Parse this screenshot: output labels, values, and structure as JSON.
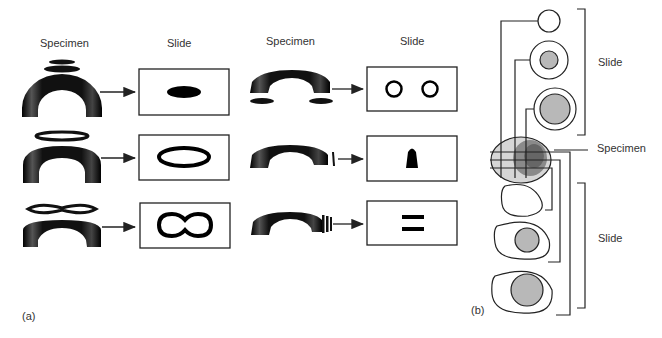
{
  "panel_a": {
    "label": "(a)",
    "headers": [
      "Specimen",
      "Slide",
      "Specimen",
      "Slide"
    ],
    "rows": [
      {
        "left_slide": "solid-ellipse",
        "right_slide": "two-rings"
      },
      {
        "left_slide": "ring-ellipse",
        "right_slide": "bullet-shape"
      },
      {
        "left_slide": "figure-eight-ring",
        "right_slide": "two-bars"
      }
    ]
  },
  "panel_b": {
    "label": "(b)",
    "bracket_top": "Slide",
    "specimen": "Specimen",
    "bracket_bottom": "Slide"
  },
  "colors": {
    "ink": "#111111",
    "gray_fill": "#b8b8b8",
    "line": "#222222"
  }
}
